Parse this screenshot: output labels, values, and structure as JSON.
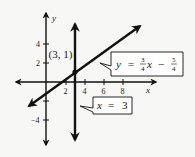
{
  "diagram": {
    "type": "coordinate-graph",
    "axes": {
      "x_label": "x",
      "y_label": "y",
      "x_ticks": [
        {
          "value": 2,
          "label": "2"
        },
        {
          "value": 4,
          "label": "4"
        },
        {
          "value": 6,
          "label": "6"
        },
        {
          "value": 8,
          "label": "8"
        }
      ],
      "y_ticks": [
        {
          "value": 4,
          "label": "4"
        },
        {
          "value": 2,
          "label": "2"
        },
        {
          "value": -2,
          "label": ""
        },
        {
          "value": -4,
          "label": "−4"
        }
      ]
    },
    "point": {
      "label": "(3, 1)",
      "x": 3,
      "y": 1
    },
    "lines": [
      {
        "name": "slanted-line",
        "equation_display": {
          "lhs": "y",
          "eq": "=",
          "coef_num": "3",
          "coef_den": "4",
          "var": "x",
          "op": "−",
          "const_num": "5",
          "const_den": "4"
        },
        "equation": "y = 3/4 x − 5/4"
      },
      {
        "name": "vertical-line",
        "equation_display": {
          "lhs": "x",
          "eq": "=",
          "rhs": "3"
        },
        "equation": "x = 3"
      }
    ],
    "colors": {
      "ink": "#111111",
      "background": "#f7f7f5",
      "callout_fill": "#ffffff"
    }
  }
}
